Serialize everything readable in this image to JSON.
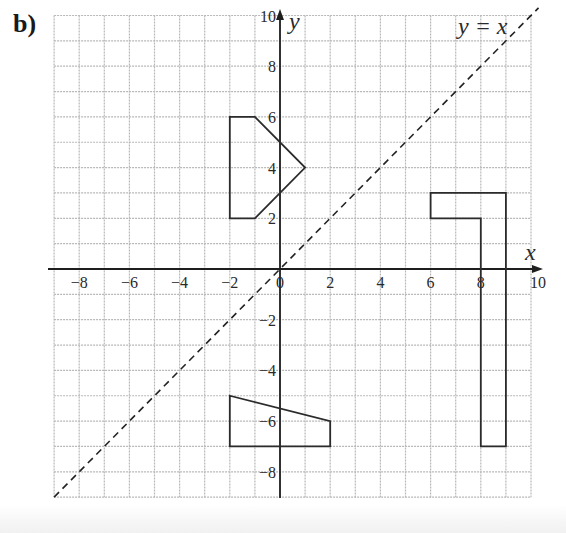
{
  "part_label": "b)",
  "axes": {
    "x_label": "x",
    "y_label": "y",
    "x_range": [
      -9,
      10
    ],
    "y_range": [
      -9,
      10
    ],
    "x_tick_labels": [
      "−8",
      "−6",
      "−4",
      "−2",
      "0",
      "2",
      "4",
      "6",
      "8",
      "10"
    ],
    "x_tick_values": [
      -8,
      -6,
      -4,
      -2,
      0,
      2,
      4,
      6,
      8,
      10
    ],
    "y_tick_labels": [
      "10",
      "8",
      "6",
      "4",
      "2",
      "−2",
      "−4",
      "−6",
      "−8"
    ],
    "y_tick_values": [
      10,
      8,
      6,
      4,
      2,
      -2,
      -4,
      -6,
      -8
    ],
    "grid": true,
    "grid_step": 1
  },
  "mirror_line": {
    "label": "y = x",
    "style": "dashed",
    "from": [
      -9,
      -9
    ],
    "to": [
      10.3,
      10.3
    ]
  },
  "shapes": [
    {
      "name": "pentagon-shape",
      "vertices": [
        [
          -2,
          2
        ],
        [
          -2,
          6
        ],
        [
          -1,
          6
        ],
        [
          1,
          4
        ],
        [
          -1,
          2
        ]
      ]
    },
    {
      "name": "trapezium-shape",
      "vertices": [
        [
          -2,
          -5
        ],
        [
          2,
          -6
        ],
        [
          2,
          -7
        ],
        [
          -2,
          -7
        ]
      ]
    },
    {
      "name": "l-shape",
      "vertices": [
        [
          6,
          3
        ],
        [
          9,
          3
        ],
        [
          9,
          -7
        ],
        [
          8,
          -7
        ],
        [
          8,
          2
        ],
        [
          6,
          2
        ]
      ]
    }
  ],
  "colors": {
    "grid": "#b8b8b8",
    "axis": "#1e1e1e",
    "shape_stroke": "#2b2b2b",
    "text": "#2a2a2a"
  }
}
